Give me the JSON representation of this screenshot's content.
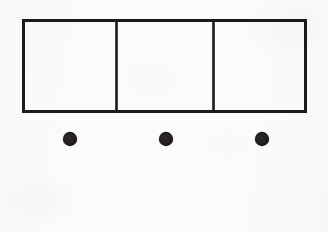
{
  "figure": {
    "background_color": "#fbfbfa",
    "ink_color": "#1b1b1f",
    "accent_red": "#8e3b3f",
    "accent_blue_gray": "#3a4550",
    "canvas": {
      "width": 328,
      "height": 232
    },
    "elements": {
      "rectangle": {
        "name": "Divided rectangle",
        "x": 22,
        "y": 19,
        "width": 285,
        "height": 94,
        "stroke_width": 3,
        "stroke_color": "#1b1b1f",
        "fill": "none",
        "cell_count": 3,
        "divider_x": [
          116,
          213
        ]
      },
      "dots": {
        "name": "Row of filled dots",
        "count": 3,
        "radius": 7,
        "fill": "#231f20",
        "centers": [
          {
            "cx": 70,
            "cy": 139
          },
          {
            "cx": 166,
            "cy": 139
          },
          {
            "cx": 262,
            "cy": 139
          }
        ]
      },
      "solid_line": {
        "name": "Solid horizontal rule",
        "x1": 22,
        "x2": 308,
        "y": 173,
        "stroke_width": 2.2,
        "style": "solid",
        "color_start": "#8e3b3f",
        "color_end": "#36414d"
      },
      "dashed_line": {
        "name": "Dashed horizontal rule",
        "x1": 22,
        "x2": 302,
        "y": 205,
        "stroke_width": 3,
        "style": "dashed",
        "dash_length": 14,
        "gap_length": 8,
        "color_start": "#8e3b3f",
        "color_end": "#3c4752"
      }
    }
  }
}
